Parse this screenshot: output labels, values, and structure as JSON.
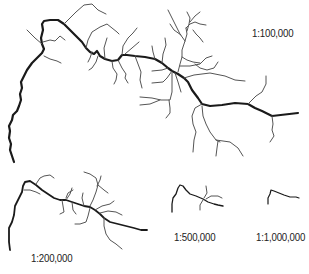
{
  "figure": {
    "colors": {
      "background": "#ffffff",
      "main_channel": "#1a1a1a",
      "tributaries": "#555555",
      "text": "#222222"
    },
    "panels": [
      {
        "id": "scale-100k",
        "label": "1:100,000"
      },
      {
        "id": "scale-200k",
        "label": "1:200,000"
      },
      {
        "id": "scale-500k",
        "label": "1:500,000"
      },
      {
        "id": "scale-1m",
        "label": "1:1,000,000"
      }
    ]
  }
}
